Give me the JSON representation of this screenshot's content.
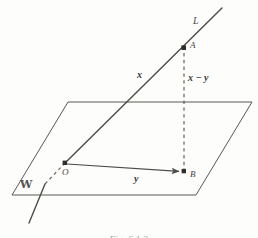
{
  "figure": {
    "type": "geometry-diagram",
    "caption": "Fig. 6.1.2",
    "ink_color": "#4a4846",
    "paper_color": "#fdfdfb",
    "labels": {
      "line": "L",
      "plane": "W",
      "point_origin": "O",
      "point_a": "A",
      "point_b": "B",
      "vector_x": "x",
      "vector_y": "y",
      "vector_difference": "x − y"
    },
    "points": {
      "O": {
        "x": 65,
        "y": 163
      },
      "A": {
        "x": 184,
        "y": 48
      },
      "B": {
        "x": 184,
        "y": 172
      }
    },
    "plane_corners": [
      {
        "x": 68,
        "y": 102
      },
      {
        "x": 252,
        "y": 102
      },
      {
        "x": 196,
        "y": 195
      },
      {
        "x": 12,
        "y": 195
      }
    ],
    "line_endpoints": {
      "top": {
        "x": 222,
        "y": 8
      },
      "bottom": {
        "x": 30,
        "y": 222
      }
    },
    "dashed_segments": [
      {
        "name": "line-hidden-below-plane",
        "from": {
          "x": 65,
          "y": 163
        },
        "to": {
          "x": 44,
          "y": 186
        }
      },
      {
        "name": "altitude-A-to-B",
        "from": {
          "x": 184,
          "y": 52
        },
        "to": {
          "x": 184,
          "y": 170
        }
      }
    ]
  }
}
